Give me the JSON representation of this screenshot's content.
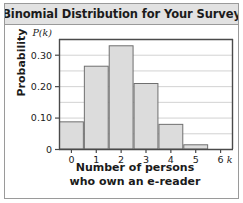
{
  "header": {
    "title": "Binomial Distribution for Your Survey"
  },
  "axes": {
    "ylabel": "Probability",
    "y_var_label": "P(k)",
    "xlabel_line1": "Number of persons",
    "xlabel_line2": "who own an e-reader",
    "x_var_label": "k",
    "ytick_labels": [
      "0",
      "0.10",
      "0.20",
      "0.30"
    ],
    "xtick_labels": [
      "0",
      "1",
      "2",
      "3",
      "4",
      "5",
      "6"
    ]
  },
  "colors": {
    "bar_fill": "#dcdcdc",
    "bar_stroke": "#6f6f6f",
    "gridline": "#d2d2d2",
    "axis": "#4a4a4a",
    "frame": "#9a9a9a",
    "header_bg": "#e2e2e2",
    "text": "#1b1b1b"
  },
  "chart_data": {
    "type": "bar",
    "title": "Binomial Distribution for Your Survey",
    "xlabel": "Number of persons who own an e-reader",
    "ylabel": "Probability",
    "categories": [
      "0",
      "1",
      "2",
      "3",
      "4",
      "5",
      "6"
    ],
    "values": [
      0.088,
      0.265,
      0.33,
      0.21,
      0.08,
      0.015,
      0.001
    ],
    "ylim": [
      0,
      0.35
    ],
    "yticks": [
      0,
      0.1,
      0.2,
      0.3
    ],
    "yticks_minor": [
      0.05,
      0.15,
      0.25,
      0.35
    ],
    "xlim": [
      0,
      7
    ],
    "grid": "horizontal",
    "legend": "none"
  }
}
